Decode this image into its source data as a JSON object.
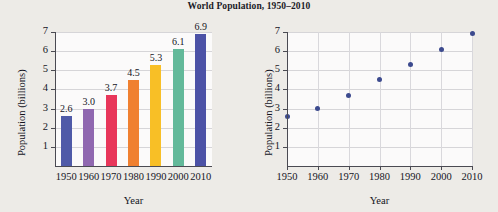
{
  "title": "World Population, 1950–2010",
  "background_color": "#edebe7",
  "chart_data": [
    {
      "type": "bar",
      "title": "World Population, 1950–2010",
      "xlabel": "Year",
      "ylabel": "Population (billions)",
      "categories": [
        "1950",
        "1960",
        "1970",
        "1980",
        "1990",
        "2000",
        "2010"
      ],
      "values": [
        2.6,
        3.0,
        3.7,
        4.5,
        5.3,
        6.1,
        6.9
      ],
      "value_labels": [
        "2.6",
        "3.0",
        "3.7",
        "4.5",
        "5.3",
        "6.1",
        "6.9"
      ],
      "bar_colors": [
        "#4f5aa8",
        "#9068b0",
        "#e8365a",
        "#f08030",
        "#f8bf26",
        "#63b99a",
        "#4c52a6"
      ],
      "ylim": [
        0,
        7
      ],
      "yticks": [
        "7",
        "6",
        "5",
        "4",
        "3",
        "2",
        "1"
      ],
      "ytick_values": [
        7,
        6,
        5,
        4,
        3,
        2,
        1
      ],
      "grid": "horizontal",
      "legend": "none"
    },
    {
      "type": "scatter",
      "title": "",
      "xlabel": "Year",
      "ylabel": "Population (billions)",
      "x": [
        1950,
        1960,
        1970,
        1980,
        1990,
        2000,
        2010
      ],
      "y": [
        2.6,
        3.0,
        3.7,
        4.5,
        5.3,
        6.1,
        6.9
      ],
      "xticks": [
        "1950",
        "1960",
        "1970",
        "1980",
        "1990",
        "2000",
        "2010"
      ],
      "yticks": [
        "7",
        "6",
        "5",
        "4",
        "3",
        "2",
        "1"
      ],
      "ytick_values": [
        7,
        6,
        5,
        4,
        3,
        2,
        1
      ],
      "xlim": [
        1950,
        2010
      ],
      "ylim": [
        0,
        7
      ],
      "marker_color": "#3c4a8e",
      "grid": "both",
      "legend": "none"
    }
  ]
}
